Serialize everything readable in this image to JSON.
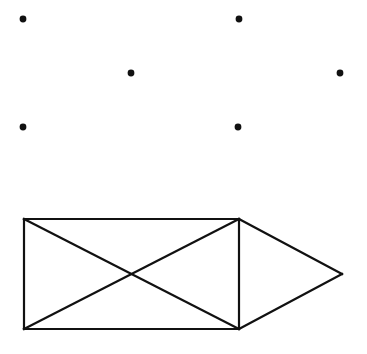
{
  "canvas": {
    "width": 367,
    "height": 354,
    "background_color": "#ffffff",
    "stroke_color": "#111111",
    "dot_color": "#111111"
  },
  "figure": {
    "stroke_width": 2.2,
    "dot_radius": 3.4
  },
  "dots": [
    {
      "name": "dot-1",
      "x": 23,
      "y": 19
    },
    {
      "name": "dot-2",
      "x": 239,
      "y": 19
    },
    {
      "name": "dot-3",
      "x": 131,
      "y": 73
    },
    {
      "name": "dot-4",
      "x": 340,
      "y": 73
    },
    {
      "name": "dot-5",
      "x": 23,
      "y": 127
    },
    {
      "name": "dot-6",
      "x": 238,
      "y": 127
    }
  ],
  "vertices": {
    "rect_top_left": {
      "x": 24,
      "y": 219
    },
    "rect_top_right": {
      "x": 239,
      "y": 219
    },
    "rect_bottom_right": {
      "x": 239,
      "y": 329
    },
    "rect_bottom_left": {
      "x": 24,
      "y": 329
    },
    "triangle_apex": {
      "x": 342,
      "y": 274
    }
  },
  "segments": [
    {
      "name": "rect-top-edge",
      "x1": 24,
      "y1": 219,
      "x2": 239,
      "y2": 219
    },
    {
      "name": "rect-right-edge",
      "x1": 239,
      "y1": 219,
      "x2": 239,
      "y2": 329
    },
    {
      "name": "rect-bottom-edge",
      "x1": 239,
      "y1": 329,
      "x2": 24,
      "y2": 329
    },
    {
      "name": "rect-left-edge",
      "x1": 24,
      "y1": 329,
      "x2": 24,
      "y2": 219
    },
    {
      "name": "rect-diagonal-tl-br",
      "x1": 24,
      "y1": 219,
      "x2": 239,
      "y2": 329
    },
    {
      "name": "rect-diagonal-bl-tr",
      "x1": 24,
      "y1": 329,
      "x2": 239,
      "y2": 219
    },
    {
      "name": "triangle-upper-edge",
      "x1": 239,
      "y1": 219,
      "x2": 342,
      "y2": 274
    },
    {
      "name": "triangle-lower-edge",
      "x1": 342,
      "y1": 274,
      "x2": 239,
      "y2": 329
    }
  ],
  "chart_data": {
    "type": "scatter",
    "title": "",
    "xlabel": "",
    "ylabel": "",
    "xlim": [
      0,
      367
    ],
    "ylim": [
      0,
      354
    ],
    "grid": false,
    "legend": "none",
    "series": [
      {
        "name": "scattered-points",
        "marker": "filled-circle",
        "color": "#111111",
        "points": [
          {
            "x": 23,
            "y": 19
          },
          {
            "x": 239,
            "y": 19
          },
          {
            "x": 131,
            "y": 73
          },
          {
            "x": 340,
            "y": 73
          },
          {
            "x": 23,
            "y": 127
          },
          {
            "x": 238,
            "y": 127
          }
        ]
      }
    ],
    "shapes": [
      {
        "name": "rectangle-with-diagonals",
        "type": "polygon",
        "points": [
          [
            24,
            219
          ],
          [
            239,
            219
          ],
          [
            239,
            329
          ],
          [
            24,
            329
          ]
        ],
        "extra_segments": [
          [
            [
              24,
              219
            ],
            [
              239,
              329
            ]
          ],
          [
            [
              24,
              329
            ],
            [
              239,
              219
            ]
          ]
        ]
      },
      {
        "name": "right-triangle-arrow",
        "type": "polygon",
        "points": [
          [
            239,
            219
          ],
          [
            342,
            274
          ],
          [
            239,
            329
          ]
        ]
      }
    ]
  }
}
